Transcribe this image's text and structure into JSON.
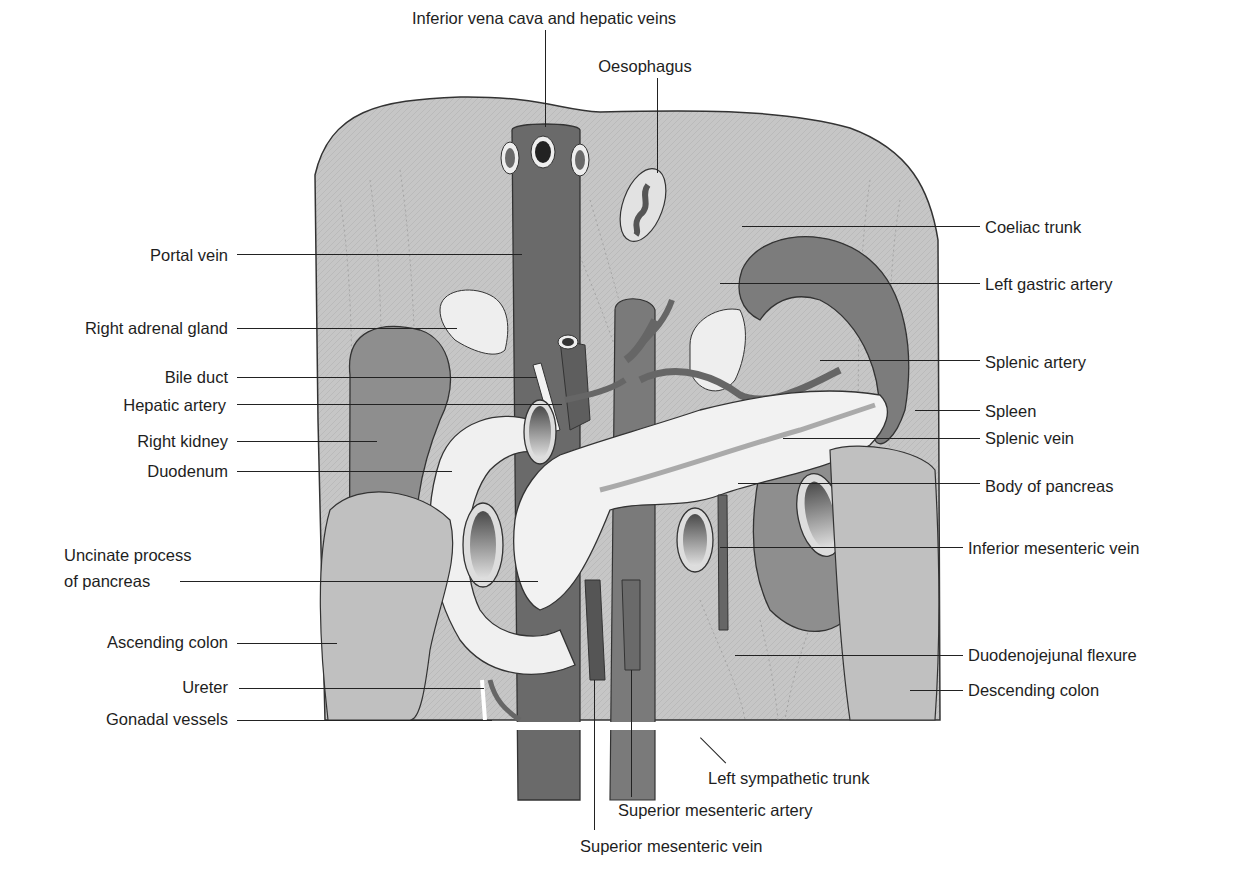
{
  "figure": {
    "colors": {
      "background": "#ffffff",
      "diaphragm": "#b9b9b9",
      "posterior_wall": "#c8c8c8",
      "vessel_dark": "#6e6e6e",
      "organ_mid": "#8a8a8a",
      "pancreas": "#f2f2f2",
      "colon": "#c4c4c4",
      "label_text": "#1e1e1e",
      "leader_line": "#222222"
    }
  },
  "labels": {
    "top": [
      {
        "id": "ivc",
        "text": "Inferior vena cava and hepatic veins"
      },
      {
        "id": "oesophagus",
        "text": "Oesophagus"
      }
    ],
    "left": [
      {
        "id": "portal_vein",
        "text": "Portal vein"
      },
      {
        "id": "right_adrenal",
        "text": "Right adrenal gland"
      },
      {
        "id": "bile_duct",
        "text": "Bile duct"
      },
      {
        "id": "hepatic_artery",
        "text": "Hepatic artery"
      },
      {
        "id": "right_kidney",
        "text": "Right kidney"
      },
      {
        "id": "duodenum",
        "text": "Duodenum"
      },
      {
        "id": "uncinate_1",
        "text": "Uncinate process"
      },
      {
        "id": "uncinate_2",
        "text": "of pancreas"
      },
      {
        "id": "ascending_colon",
        "text": "Ascending colon"
      },
      {
        "id": "ureter",
        "text": "Ureter"
      },
      {
        "id": "gonadal",
        "text": "Gonadal vessels"
      }
    ],
    "right": [
      {
        "id": "coeliac",
        "text": "Coeliac trunk"
      },
      {
        "id": "left_gastric",
        "text": "Left gastric artery"
      },
      {
        "id": "splenic_artery",
        "text": "Splenic artery"
      },
      {
        "id": "spleen",
        "text": "Spleen"
      },
      {
        "id": "splenic_vein",
        "text": "Splenic vein"
      },
      {
        "id": "body_pancreas",
        "text": "Body of pancreas"
      },
      {
        "id": "imv",
        "text": "Inferior mesenteric vein"
      },
      {
        "id": "dj_flexure",
        "text": "Duodenojejunal flexure"
      },
      {
        "id": "descending_colon",
        "text": "Descending colon"
      }
    ],
    "bottom": [
      {
        "id": "left_sympathetic",
        "text": "Left sympathetic trunk"
      },
      {
        "id": "sma",
        "text": "Superior mesenteric artery"
      },
      {
        "id": "smv",
        "text": "Superior mesenteric vein"
      }
    ]
  }
}
